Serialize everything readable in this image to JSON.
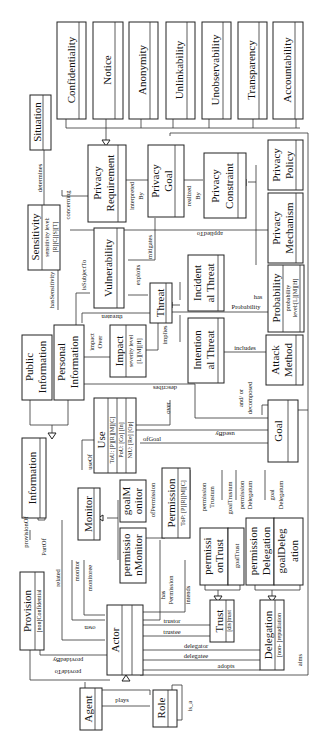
{
  "diagram": {
    "orientation": "rotated-90-ccw",
    "principles": [
      {
        "id": "confidentiality",
        "name": "Confidentiality"
      },
      {
        "id": "notice",
        "name": "Notice"
      },
      {
        "id": "anonymity",
        "name": "Anonymity"
      },
      {
        "id": "unlinkability",
        "name": "Unlinkability"
      },
      {
        "id": "unobservability",
        "name": "Unobservability"
      },
      {
        "id": "transparency",
        "name": "Transparency"
      },
      {
        "id": "accountability",
        "name": "Accountability"
      }
    ],
    "classes": {
      "situation": {
        "name": "Situation"
      },
      "sensitivity": {
        "name": "Sensitivity",
        "attr1": "sensitivity level:",
        "attr2": "[R][C][S][T]"
      },
      "privacy_requirement": {
        "name1": "Privacy",
        "name2": "Requirement"
      },
      "privacy_goal": {
        "name1": "Privacy",
        "name2": "Goal"
      },
      "privacy_constraint": {
        "name1": "Privacy",
        "name2": "Constraint"
      },
      "privacy_policy": {
        "name1": "Privacy",
        "name2": "Policy"
      },
      "privacy_mechanism": {
        "name1": "Privacy",
        "name2": "Mechanism"
      },
      "vulnerability": {
        "name": "Vulnerability"
      },
      "incidental_threat": {
        "name1": "Incident",
        "name2": "al Threat"
      },
      "threat": {
        "name": "Threat"
      },
      "probability": {
        "name": "Probability",
        "attr1": "probability",
        "attr2": "level:[L][M][H]"
      },
      "public_information": {
        "name1": "Public",
        "name2": "Information"
      },
      "personal_information": {
        "name1": "Personal",
        "name2": "Information"
      },
      "impact": {
        "name": "Impact",
        "attr1": "severity level",
        "attr2": "[L][M][H]"
      },
      "intentional_threat": {
        "name1": "Intention",
        "name2": "al Threat"
      },
      "attack_method": {
        "name1": "Attack",
        "name2": "Method"
      },
      "use": {
        "name": "Use",
        "attr1": "ToU: [P][R][M][C]",
        "attr2": "PoU: [Co] [In]",
        "attr3": "NtU: [Re] [Op]"
      },
      "goal": {
        "name": "Goal"
      },
      "information": {
        "name": "Information"
      },
      "monitor": {
        "name": "Monitor"
      },
      "goal_monitor": {
        "name1": "goalM",
        "name2": "onitor"
      },
      "permission_monitor": {
        "name1": "permissio",
        "name2": "nMonitor"
      },
      "permission": {
        "name": "Permission",
        "attr1": "ToP: [P][R][M][C]"
      },
      "permission_trust": {
        "name1": "permissi",
        "name2": "onTrust"
      },
      "goal_trust": {
        "name": "goalTrust"
      },
      "permission_delegation": {
        "name1": "permission",
        "name2": "Delegation"
      },
      "goal_delegation": {
        "name1": "goalDeleg",
        "name2": "ation"
      },
      "provision": {
        "name": "Provision",
        "attr1": "[non]Confidential"
      },
      "trust": {
        "name": "Trust",
        "attr1": "[dis]trust"
      },
      "delegation": {
        "name": "Delegation",
        "attr1": "[non- ]repudiation"
      },
      "actor": {
        "name": "Actor"
      },
      "agent": {
        "name": "Agent"
      },
      "role": {
        "name": "Role"
      }
    },
    "associations": {
      "determines": "determines",
      "concerning": "concerning",
      "interpreted_by1": "interpreted",
      "interpreted_by2": "By",
      "realized_by1": "realized",
      "realized_by2": "By",
      "applied_to": "appliedTo",
      "mitigates": "mitigates",
      "has_sensitivity": "hasSensitivity",
      "is_subject_to": "isSubjectTo",
      "exploits": "exploits",
      "threaten": "threaten",
      "has_probability1": "has",
      "has_probability2": "Probability",
      "impact_over1": "impact",
      "impact_over2": "Over",
      "implies": "implies",
      "includes": "includes",
      "describes": "describes",
      "and_or1": "and/ or",
      "and_or2": "decomposed",
      "over": "over",
      "used_by": "usedBy",
      "of_goal": "ofGoal",
      "use_of": "useOf",
      "of_permission": "ofPermission",
      "permission_trustum1": "permission",
      "permission_trustum2": "Trustum",
      "goal_trustum": "goalTrustum",
      "permission_delegatum1": "permission",
      "permission_delegatum2": "Delegatum",
      "goal_delegatum1": "goal",
      "goal_delegatum2": "Delegatum",
      "provision_of": "provisionOf",
      "part_of": "PartOf",
      "related": "related",
      "monitor": "monitor",
      "monitoree": "monitoree",
      "has_permission1": "has",
      "has_permission2": "Permission",
      "intends": "intends",
      "owns": "own",
      "trustor": "trustor",
      "trustee": "trustee",
      "delegator": "delegator",
      "delegatee": "delegatee",
      "adopts": "adopts",
      "aims": "aims",
      "provided_by": "providedBy",
      "provide_to": "provideTo",
      "plays": "plays",
      "is_a": "is_a"
    }
  }
}
